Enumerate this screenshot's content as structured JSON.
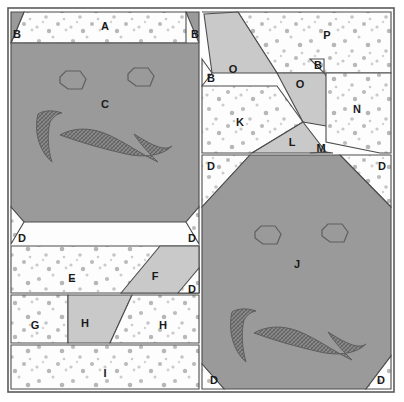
{
  "figure": {
    "width": 404,
    "height": 402
  },
  "colors": {
    "background": "#ffffff",
    "outline": "#4c4c4c",
    "dark_gray": "#9a9a9a",
    "light_gray": "#c9c9c9",
    "speckle_white": "#fdfdfd",
    "speckle_dot": "#b9b9b9",
    "hatch_shape": "#8a8a8a",
    "hatch_line": "#5e5e5e",
    "label_text": "#1a1a1a"
  },
  "frame": {
    "x": 8,
    "y": 8,
    "width": 386,
    "height": 384
  },
  "pieces": [
    {
      "id": "A",
      "label": "A",
      "fill": "speckle",
      "label_x": 105,
      "label_y": 27,
      "points": "24,12 186,12 186,43 11,43"
    },
    {
      "id": "B1",
      "label": "B",
      "fill": "dark",
      "label_x": 17,
      "label_y": 35,
      "points": "11,12 24,12 11,43"
    },
    {
      "id": "B2",
      "label": "B",
      "fill": "dark",
      "label_x": 195,
      "label_y": 35,
      "points": "186,12 199,12 199,43"
    },
    {
      "id": "C",
      "label": "C",
      "fill": "dark",
      "label_x": 105,
      "label_y": 105,
      "points": "11,43 199,43 199,207 186,222 24,222 11,207"
    },
    {
      "id": "D1",
      "label": "D",
      "fill": "speckle",
      "label_x": 22,
      "label_y": 239,
      "points": "11,207 24,222 11,244"
    },
    {
      "id": "D2",
      "label": "D",
      "fill": "speckle",
      "label_x": 192,
      "label_y": 239,
      "points": "186,222 199,207 199,244"
    },
    {
      "id": "E",
      "label": "E",
      "fill": "speckle",
      "label_x": 72,
      "label_y": 279,
      "points": "11,246 199,246 199,293 11,293"
    },
    {
      "id": "F",
      "label": "F",
      "fill": "light",
      "label_x": 155,
      "label_y": 277,
      "points": "121,293 160,246 199,246 199,293"
    },
    {
      "id": "D3",
      "label": "D",
      "fill": "speckle",
      "label_x": 192,
      "label_y": 290,
      "points": "178,293 199,268 199,293"
    },
    {
      "id": "G",
      "label": "G",
      "fill": "speckle",
      "label_x": 35,
      "label_y": 326,
      "points": "11,295 68,295 68,343 11,343"
    },
    {
      "id": "H1",
      "label": "H",
      "fill": "light",
      "label_x": 85,
      "label_y": 324,
      "points": "68,295 132,295 110,343 68,343"
    },
    {
      "id": "H2",
      "label": "H",
      "fill": "speckle",
      "label_x": 163,
      "label_y": 326,
      "points": "132,295 199,295 199,343 110,343"
    },
    {
      "id": "I",
      "label": "I",
      "fill": "speckle",
      "label_x": 105,
      "label_y": 374,
      "points": "11,345 199,345 199,389 11,389"
    },
    {
      "id": "P",
      "label": "P",
      "fill": "speckle",
      "label_x": 327,
      "label_y": 36,
      "points": "202,12 391,12 391,73 277,73 238,12"
    },
    {
      "id": "O1",
      "label": "O",
      "fill": "light",
      "label_x": 233,
      "label_y": 70,
      "points": "204,14 238,12 277,73 212,73"
    },
    {
      "id": "B3",
      "label": "B",
      "fill": "speckle",
      "label_x": 211,
      "label_y": 79,
      "points": "202,59 212,73 202,86"
    },
    {
      "id": "O2",
      "label": "O",
      "fill": "light",
      "label_x": 300,
      "label_y": 85,
      "points": "277,73 324,73 373,134 303,122"
    },
    {
      "id": "B4",
      "label": "B",
      "fill": "speckle",
      "label_x": 318,
      "label_y": 66,
      "points": "310,59 324,73 324,59"
    },
    {
      "id": "K",
      "label": "K",
      "fill": "speckle",
      "label_x": 240,
      "label_y": 123,
      "points": "202,86 277,86 303,122 252,153 202,153"
    },
    {
      "id": "N",
      "label": "N",
      "fill": "speckle",
      "label_x": 357,
      "label_y": 110,
      "points": "326,73 391,73 391,153 380,153 326,142"
    },
    {
      "id": "L",
      "label": "L",
      "fill": "light",
      "label_x": 292,
      "label_y": 143,
      "points": "303,122 326,152 310,153 252,153"
    },
    {
      "id": "M",
      "label": "M",
      "fill": "speckle",
      "label_x": 321,
      "label_y": 149,
      "points": "310,153 326,152 333,153"
    },
    {
      "id": "D4",
      "label": "D",
      "fill": "speckle",
      "label_x": 211,
      "label_y": 167,
      "points": "202,155 250,155 202,207"
    },
    {
      "id": "D5",
      "label": "D",
      "fill": "speckle",
      "label_x": 382,
      "label_y": 167,
      "points": "340,155 391,155 391,207"
    },
    {
      "id": "J",
      "label": "J",
      "fill": "dark",
      "label_x": 297,
      "label_y": 265,
      "points": "250,155 340,155 391,207 391,356 366,389 224,389 202,364 202,207"
    },
    {
      "id": "D6",
      "label": "D",
      "fill": "speckle",
      "label_x": 214,
      "label_y": 381,
      "points": "202,364 224,389 202,389"
    },
    {
      "id": "D7",
      "label": "D",
      "fill": "speckle",
      "label_x": 381,
      "label_y": 381,
      "points": "366,389 391,356 391,389"
    }
  ],
  "face_c": {
    "eye_left": "60,77 66,71 80,71 86,79 82,89 68,89 60,83",
    "eye_right": "128,74 134,68 148,68 154,76 150,86 136,86 128,80",
    "swirl": "M 38,114 C 34,130 38,150 52,162 C 48,150 47,134 50,122 C 54,116 57,114 62,113 C 54,110 44,110 38,114 Z",
    "mustache": "M 60,135 C 72,128 88,127 104,133 C 124,141 142,155 158,162 C 150,154 140,144 134,134 C 150,144 164,152 172,146 C 162,156 144,158 126,154 C 104,149 82,143 60,135 Z"
  },
  "face_j": {
    "eye_left": "255,232 261,226 275,226 281,234 277,244 263,244 255,238",
    "eye_right": "322,230 328,224 342,224 348,232 344,242 330,242 322,236",
    "swirl": "M 232,312 C 228,328 232,350 246,362 C 242,348 241,332 244,320 C 248,314 251,312 256,311 C 248,308 238,308 232,312 Z",
    "mustache": "M 254,333 C 266,326 282,325 298,331 C 318,339 336,353 352,360 C 344,352 334,342 328,332 C 344,342 358,350 366,344 C 356,354 338,356 320,352 C 298,347 276,341 254,333 Z"
  },
  "speckle_dots_seed": 20250
}
